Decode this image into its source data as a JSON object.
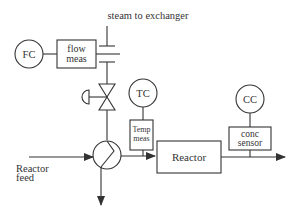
{
  "diagram": {
    "type": "process control loop diagram",
    "labels": {
      "steam": "steam to exchanger",
      "fc": "FC",
      "flow_meas_1": "flow",
      "flow_meas_2": "meas",
      "tc": "TC",
      "temp_meas_1": "Temp",
      "temp_meas_2": "meas",
      "reactor": "Reactor",
      "cc": "CC",
      "conc_sensor_1": "conc",
      "conc_sensor_2": "sensor",
      "feed_1": "Reactor",
      "feed_2": "feed"
    },
    "colors": {
      "line": "#333333",
      "background": "#ffffff"
    }
  }
}
